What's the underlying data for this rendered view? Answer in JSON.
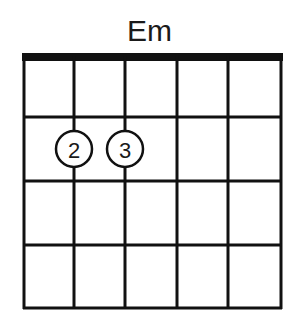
{
  "chord": {
    "name": "Em",
    "strings": 6,
    "frets": 4,
    "nut": true,
    "fingers": [
      {
        "string": 2,
        "fret": 2,
        "label": "2"
      },
      {
        "string": 3,
        "fret": 2,
        "label": "3"
      }
    ]
  },
  "colors": {
    "line": "#111111",
    "background": "#ffffff",
    "text": "#1a1a1a"
  }
}
